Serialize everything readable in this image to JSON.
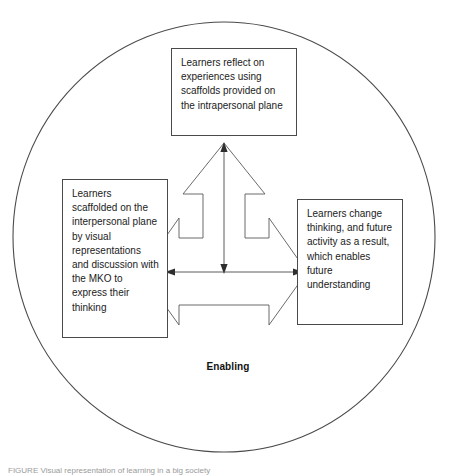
{
  "figure": {
    "type": "circular concept diagram",
    "caption": "FIGURE Visual representation of learning in a big society",
    "center_label": "Enabling",
    "boundary": {
      "shape": "circle",
      "stroke_color": "#4a4a4a",
      "fill_color": "#ffffff"
    },
    "nodes": [
      {
        "id": "top",
        "position": "top",
        "text": "Learners reflect on experiences using scaffolds provided on the intrapersonal plane"
      },
      {
        "id": "left",
        "position": "left",
        "text": "Learners scaffolded on the interpersonal plane by visual representations and discussion with the MKO to express their thinking"
      },
      {
        "id": "right",
        "position": "right",
        "text": "Learners change thinking, and future activity as a result, which enables future understanding"
      }
    ],
    "connector": {
      "name": "three-headed-outline-arrow",
      "heads": [
        "up",
        "left",
        "right"
      ],
      "inner_arrows": [
        "vertical-double-headed",
        "horizontal-double-headed"
      ],
      "stroke_color": "#555555"
    }
  }
}
